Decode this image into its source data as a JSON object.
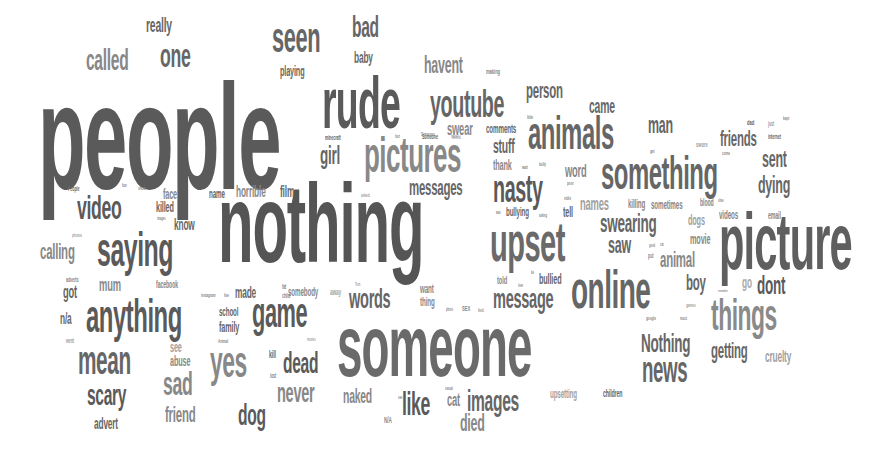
{
  "colors": {
    "dark": "#555555",
    "mid": "#6e6e6e",
    "light": "#8c8c8c",
    "faint": "#a8a8a8"
  },
  "words": [
    {
      "text": "people",
      "x": 38,
      "y": 62,
      "size": 150,
      "sx": 0.52,
      "c": "#5a5a5a"
    },
    {
      "text": "nothing",
      "x": 218,
      "y": 168,
      "size": 112,
      "sx": 0.52,
      "c": "#555555"
    },
    {
      "text": "someone",
      "x": 337,
      "y": 302,
      "size": 88,
      "sx": 0.52,
      "c": "#6a6a6a"
    },
    {
      "text": "picture",
      "x": 719,
      "y": 202,
      "size": 80,
      "sx": 0.52,
      "c": "#5f5f5f"
    },
    {
      "text": "rude",
      "x": 322,
      "y": 67,
      "size": 72,
      "sx": 0.52,
      "c": "#5a5a5a"
    },
    {
      "text": "upset",
      "x": 490,
      "y": 214,
      "size": 56,
      "sx": 0.52,
      "c": "#6a6a6a"
    },
    {
      "text": "online",
      "x": 571,
      "y": 262,
      "size": 54,
      "sx": 0.52,
      "c": "#666666"
    },
    {
      "text": "pictures",
      "x": 364,
      "y": 130,
      "size": 50,
      "sx": 0.52,
      "c": "#888888"
    },
    {
      "text": "something",
      "x": 601,
      "y": 150,
      "size": 46,
      "sx": 0.52,
      "c": "#666666"
    },
    {
      "text": "animals",
      "x": 528,
      "y": 110,
      "size": 46,
      "sx": 0.52,
      "c": "#666666"
    },
    {
      "text": "saying",
      "x": 97,
      "y": 226,
      "size": 48,
      "sx": 0.52,
      "c": "#5a5a5a"
    },
    {
      "text": "anything",
      "x": 86,
      "y": 293,
      "size": 46,
      "sx": 0.52,
      "c": "#5a5a5a"
    },
    {
      "text": "seen",
      "x": 272,
      "y": 17,
      "size": 42,
      "sx": 0.52,
      "c": "#666666"
    },
    {
      "text": "youtube",
      "x": 430,
      "y": 85,
      "size": 38,
      "sx": 0.52,
      "c": "#666666"
    },
    {
      "text": "mean",
      "x": 78,
      "y": 340,
      "size": 40,
      "sx": 0.52,
      "c": "#666666"
    },
    {
      "text": "game",
      "x": 252,
      "y": 292,
      "size": 42,
      "sx": 0.52,
      "c": "#5a5a5a"
    },
    {
      "text": "yes",
      "x": 210,
      "y": 340,
      "size": 44,
      "sx": 0.52,
      "c": "#888888"
    },
    {
      "text": "things",
      "x": 711,
      "y": 293,
      "size": 44,
      "sx": 0.52,
      "c": "#8a8a8a"
    },
    {
      "text": "nasty",
      "x": 493,
      "y": 170,
      "size": 38,
      "sx": 0.52,
      "c": "#5a5a5a"
    },
    {
      "text": "video",
      "x": 77,
      "y": 190,
      "size": 34,
      "sx": 0.52,
      "c": "#5a5a5a"
    },
    {
      "text": "one",
      "x": 160,
      "y": 38,
      "size": 34,
      "sx": 0.52,
      "c": "#666666"
    },
    {
      "text": "called",
      "x": 86,
      "y": 45,
      "size": 30,
      "sx": 0.52,
      "c": "#888888"
    },
    {
      "text": "bad",
      "x": 352,
      "y": 12,
      "size": 30,
      "sx": 0.52,
      "c": "#666666"
    },
    {
      "text": "sad",
      "x": 163,
      "y": 366,
      "size": 34,
      "sx": 0.52,
      "c": "#888888"
    },
    {
      "text": "scary",
      "x": 87,
      "y": 380,
      "size": 30,
      "sx": 0.52,
      "c": "#5a5a5a"
    },
    {
      "text": "news",
      "x": 642,
      "y": 352,
      "size": 36,
      "sx": 0.52,
      "c": "#666666"
    },
    {
      "text": "Nothing",
      "x": 641,
      "y": 330,
      "size": 26,
      "sx": 0.52,
      "c": "#666666"
    },
    {
      "text": "dead",
      "x": 283,
      "y": 348,
      "size": 30,
      "sx": 0.52,
      "c": "#5a5a5a"
    },
    {
      "text": "never",
      "x": 277,
      "y": 379,
      "size": 28,
      "sx": 0.52,
      "c": "#888888"
    },
    {
      "text": "like",
      "x": 402,
      "y": 386,
      "size": 34,
      "sx": 0.52,
      "c": "#5a5a5a"
    },
    {
      "text": "images",
      "x": 467,
      "y": 386,
      "size": 30,
      "sx": 0.52,
      "c": "#666666"
    },
    {
      "text": "words",
      "x": 349,
      "y": 285,
      "size": 28,
      "sx": 0.52,
      "c": "#666666"
    },
    {
      "text": "message",
      "x": 493,
      "y": 285,
      "size": 28,
      "sx": 0.52,
      "c": "#666666"
    },
    {
      "text": "dog",
      "x": 238,
      "y": 400,
      "size": 30,
      "sx": 0.52,
      "c": "#5a5a5a"
    },
    {
      "text": "died",
      "x": 460,
      "y": 411,
      "size": 24,
      "sx": 0.52,
      "c": "#888888"
    },
    {
      "text": "naked",
      "x": 343,
      "y": 386,
      "size": 20,
      "sx": 0.52,
      "c": "#888888"
    },
    {
      "text": "cat",
      "x": 447,
      "y": 391,
      "size": 18,
      "sx": 0.52,
      "c": "#888888"
    },
    {
      "text": "girl",
      "x": 320,
      "y": 142,
      "size": 26,
      "sx": 0.52,
      "c": "#666666"
    },
    {
      "text": "messages",
      "x": 409,
      "y": 177,
      "size": 22,
      "sx": 0.52,
      "c": "#666666"
    },
    {
      "text": "havent",
      "x": 424,
      "y": 53,
      "size": 24,
      "sx": 0.52,
      "c": "#888888"
    },
    {
      "text": "person",
      "x": 526,
      "y": 80,
      "size": 22,
      "sx": 0.52,
      "c": "#666666"
    },
    {
      "text": "came",
      "x": 589,
      "y": 96,
      "size": 20,
      "sx": 0.52,
      "c": "#666666"
    },
    {
      "text": "man",
      "x": 648,
      "y": 113,
      "size": 24,
      "sx": 0.52,
      "c": "#666666"
    },
    {
      "text": "friends",
      "x": 720,
      "y": 128,
      "size": 22,
      "sx": 0.52,
      "c": "#666666"
    },
    {
      "text": "sent",
      "x": 762,
      "y": 147,
      "size": 24,
      "sx": 0.52,
      "c": "#666666"
    },
    {
      "text": "dying",
      "x": 758,
      "y": 173,
      "size": 24,
      "sx": 0.52,
      "c": "#666666"
    },
    {
      "text": "swearing",
      "x": 600,
      "y": 210,
      "size": 26,
      "sx": 0.52,
      "c": "#666666"
    },
    {
      "text": "saw",
      "x": 608,
      "y": 233,
      "size": 24,
      "sx": 0.52,
      "c": "#666666"
    },
    {
      "text": "animal",
      "x": 660,
      "y": 249,
      "size": 22,
      "sx": 0.52,
      "c": "#888888"
    },
    {
      "text": "boy",
      "x": 686,
      "y": 272,
      "size": 22,
      "sx": 0.52,
      "c": "#666666"
    },
    {
      "text": "dont",
      "x": 757,
      "y": 272,
      "size": 26,
      "sx": 0.52,
      "c": "#5a5a5a"
    },
    {
      "text": "go",
      "x": 742,
      "y": 275,
      "size": 16,
      "sx": 0.52,
      "c": "#a8a8a8"
    },
    {
      "text": "getting",
      "x": 711,
      "y": 340,
      "size": 22,
      "sx": 0.52,
      "c": "#666666"
    },
    {
      "text": "cruelty",
      "x": 765,
      "y": 349,
      "size": 16,
      "sx": 0.52,
      "c": "#a0a0a0"
    },
    {
      "text": "stuff",
      "x": 493,
      "y": 136,
      "size": 20,
      "sx": 0.52,
      "c": "#666666"
    },
    {
      "text": "thank",
      "x": 493,
      "y": 158,
      "size": 14,
      "sx": 0.52,
      "c": "#888888"
    },
    {
      "text": "word",
      "x": 565,
      "y": 162,
      "size": 18,
      "sx": 0.52,
      "c": "#888888"
    },
    {
      "text": "names",
      "x": 580,
      "y": 195,
      "size": 18,
      "sx": 0.52,
      "c": "#a0a0a0"
    },
    {
      "text": "swear",
      "x": 447,
      "y": 120,
      "size": 18,
      "sx": 0.52,
      "c": "#888888"
    },
    {
      "text": "comments",
      "x": 486,
      "y": 123,
      "size": 12,
      "sx": 0.52,
      "c": "#666666"
    },
    {
      "text": "really",
      "x": 146,
      "y": 15,
      "size": 20,
      "sx": 0.52,
      "c": "#666666"
    },
    {
      "text": "baby",
      "x": 354,
      "y": 50,
      "size": 16,
      "sx": 0.52,
      "c": "#666666"
    },
    {
      "text": "playing",
      "x": 280,
      "y": 64,
      "size": 14,
      "sx": 0.52,
      "c": "#666666"
    },
    {
      "text": "calling",
      "x": 40,
      "y": 241,
      "size": 22,
      "sx": 0.52,
      "c": "#888888"
    },
    {
      "text": "got",
      "x": 63,
      "y": 283,
      "size": 18,
      "sx": 0.52,
      "c": "#666666"
    },
    {
      "text": "mum",
      "x": 99,
      "y": 276,
      "size": 18,
      "sx": 0.52,
      "c": "#888888"
    },
    {
      "text": "n/a",
      "x": 60,
      "y": 311,
      "size": 16,
      "sx": 0.52,
      "c": "#666666"
    },
    {
      "text": "friend",
      "x": 165,
      "y": 404,
      "size": 22,
      "sx": 0.52,
      "c": "#888888"
    },
    {
      "text": "advert",
      "x": 94,
      "y": 416,
      "size": 16,
      "sx": 0.52,
      "c": "#666666"
    },
    {
      "text": "abuse",
      "x": 170,
      "y": 354,
      "size": 14,
      "sx": 0.52,
      "c": "#888888"
    },
    {
      "text": "see",
      "x": 170,
      "y": 340,
      "size": 14,
      "sx": 0.52,
      "c": "#a0a0a0"
    },
    {
      "text": "school",
      "x": 219,
      "y": 306,
      "size": 12,
      "sx": 0.52,
      "c": "#666666"
    },
    {
      "text": "family",
      "x": 219,
      "y": 320,
      "size": 14,
      "sx": 0.52,
      "c": "#666666"
    },
    {
      "text": "made",
      "x": 235,
      "y": 285,
      "size": 16,
      "sx": 0.52,
      "c": "#666666"
    },
    {
      "text": "face",
      "x": 163,
      "y": 187,
      "size": 14,
      "sx": 0.52,
      "c": "#888888"
    },
    {
      "text": "killed",
      "x": 156,
      "y": 200,
      "size": 14,
      "sx": 0.52,
      "c": "#666666"
    },
    {
      "text": "know",
      "x": 174,
      "y": 217,
      "size": 16,
      "sx": 0.52,
      "c": "#666666"
    },
    {
      "text": "name",
      "x": 209,
      "y": 188,
      "size": 12,
      "sx": 0.52,
      "c": "#666666"
    },
    {
      "text": "horrible",
      "x": 236,
      "y": 184,
      "size": 16,
      "sx": 0.52,
      "c": "#888888"
    },
    {
      "text": "film",
      "x": 280,
      "y": 184,
      "size": 16,
      "sx": 0.52,
      "c": "#666666"
    },
    {
      "text": "facebook",
      "x": 156,
      "y": 280,
      "size": 10,
      "sx": 0.52,
      "c": "#888888"
    },
    {
      "text": "somebody",
      "x": 288,
      "y": 286,
      "size": 12,
      "sx": 0.52,
      "c": "#888888"
    },
    {
      "text": "away",
      "x": 330,
      "y": 288,
      "size": 9,
      "sx": 0.52,
      "c": "#a0a0a0"
    },
    {
      "text": "want",
      "x": 420,
      "y": 283,
      "size": 12,
      "sx": 0.52,
      "c": "#888888"
    },
    {
      "text": "thing",
      "x": 420,
      "y": 296,
      "size": 12,
      "sx": 0.52,
      "c": "#888888"
    },
    {
      "text": "told",
      "x": 497,
      "y": 275,
      "size": 11,
      "sx": 0.52,
      "c": "#888888"
    },
    {
      "text": "bullied",
      "x": 539,
      "y": 272,
      "size": 14,
      "sx": 0.52,
      "c": "#666666"
    },
    {
      "text": "bullying",
      "x": 506,
      "y": 206,
      "size": 12,
      "sx": 0.52,
      "c": "#666666"
    },
    {
      "text": "tell",
      "x": 563,
      "y": 205,
      "size": 14,
      "sx": 0.52,
      "c": "#666666"
    },
    {
      "text": "killing",
      "x": 628,
      "y": 198,
      "size": 12,
      "sx": 0.52,
      "c": "#888888"
    },
    {
      "text": "sometimes",
      "x": 651,
      "y": 199,
      "size": 12,
      "sx": 0.52,
      "c": "#888888"
    },
    {
      "text": "dogs",
      "x": 688,
      "y": 213,
      "size": 14,
      "sx": 0.52,
      "c": "#a0a0a0"
    },
    {
      "text": "movie",
      "x": 690,
      "y": 232,
      "size": 14,
      "sx": 0.52,
      "c": "#888888"
    },
    {
      "text": "blood",
      "x": 700,
      "y": 198,
      "size": 10,
      "sx": 0.52,
      "c": "#888888"
    },
    {
      "text": "videos",
      "x": 719,
      "y": 209,
      "size": 12,
      "sx": 0.52,
      "c": "#888888"
    },
    {
      "text": "email",
      "x": 768,
      "y": 211,
      "size": 10,
      "sx": 0.52,
      "c": "#888888"
    },
    {
      "text": "upsetting",
      "x": 550,
      "y": 388,
      "size": 12,
      "sx": 0.52,
      "c": "#a0a0a0"
    },
    {
      "text": "children",
      "x": 603,
      "y": 389,
      "size": 10,
      "sx": 0.52,
      "c": "#666666"
    },
    {
      "text": "N/A",
      "x": 384,
      "y": 416,
      "size": 9,
      "sx": 0.52,
      "c": "#888888"
    },
    {
      "text": "kill",
      "x": 269,
      "y": 350,
      "size": 10,
      "sx": 0.52,
      "c": "#666666"
    },
    {
      "text": "lost",
      "x": 270,
      "y": 372,
      "size": 7,
      "sx": 0.52,
      "c": "#888888"
    },
    {
      "text": "adverts",
      "x": 66,
      "y": 276,
      "size": 7,
      "sx": 0.52,
      "c": "#888888"
    },
    {
      "text": "photos",
      "x": 72,
      "y": 232,
      "size": 6,
      "sx": 0.52,
      "c": "#a0a0a0"
    },
    {
      "text": "went",
      "x": 66,
      "y": 337,
      "size": 7,
      "sx": 0.52,
      "c": "#a0a0a0"
    },
    {
      "text": "People",
      "x": 68,
      "y": 185,
      "size": 7,
      "sx": 0.52,
      "c": "#666666"
    },
    {
      "text": "fun",
      "x": 122,
      "y": 182,
      "size": 6,
      "sx": 0.52,
      "c": "#888888"
    },
    {
      "text": "show",
      "x": 138,
      "y": 185,
      "size": 6,
      "sx": 0.52,
      "c": "#888888"
    },
    {
      "text": "images",
      "x": 157,
      "y": 216,
      "size": 5,
      "sx": 0.52,
      "c": "#888888"
    },
    {
      "text": "instagram",
      "x": 201,
      "y": 292,
      "size": 6,
      "sx": 0.52,
      "c": "#888888"
    },
    {
      "text": "live",
      "x": 224,
      "y": 292,
      "size": 6,
      "sx": 0.52,
      "c": "#888888"
    },
    {
      "text": "Animal",
      "x": 218,
      "y": 338,
      "size": 6,
      "sx": 0.52,
      "c": "#888888"
    },
    {
      "text": "fat",
      "x": 282,
      "y": 283,
      "size": 7,
      "sx": 0.52,
      "c": "#888888"
    },
    {
      "text": "child",
      "x": 282,
      "y": 292,
      "size": 7,
      "sx": 0.52,
      "c": "#888888"
    },
    {
      "text": "movies",
      "x": 307,
      "y": 337,
      "size": 5,
      "sx": 0.52,
      "c": "#a0a0a0"
    },
    {
      "text": "Tom",
      "x": 355,
      "y": 282,
      "size": 5,
      "sx": 0.52,
      "c": "#a0a0a0"
    },
    {
      "text": "photo",
      "x": 446,
      "y": 307,
      "size": 5,
      "sx": 0.52,
      "c": "#888888"
    },
    {
      "text": "SEX",
      "x": 462,
      "y": 305,
      "size": 8,
      "sx": 0.52,
      "c": "#888888"
    },
    {
      "text": "food",
      "x": 478,
      "y": 308,
      "size": 5,
      "sx": 0.52,
      "c": "#888888"
    },
    {
      "text": "love",
      "x": 518,
      "y": 283,
      "size": 5,
      "sx": 0.52,
      "c": "#888888"
    },
    {
      "text": "be",
      "x": 531,
      "y": 270,
      "size": 5,
      "sx": 0.52,
      "c": "#888888"
    },
    {
      "text": "sexual",
      "x": 445,
      "y": 386,
      "size": 5,
      "sx": 0.52,
      "c": "#888888"
    },
    {
      "text": "see",
      "x": 398,
      "y": 395,
      "size": 5,
      "sx": 0.52,
      "c": "#888888"
    },
    {
      "text": "minecraft",
      "x": 325,
      "y": 134,
      "size": 7,
      "sx": 0.52,
      "c": "#666666"
    },
    {
      "text": "hurt",
      "x": 395,
      "y": 134,
      "size": 5,
      "sx": 0.52,
      "c": "#888888"
    },
    {
      "text": "Someone",
      "x": 422,
      "y": 133,
      "size": 7,
      "sx": 0.52,
      "c": "#666666"
    },
    {
      "text": "horror",
      "x": 451,
      "y": 134,
      "size": 5,
      "sx": 0.52,
      "c": "#a0a0a0"
    },
    {
      "text": "asked",
      "x": 361,
      "y": 192,
      "size": 6,
      "sx": 0.52,
      "c": "#a0a0a0"
    },
    {
      "text": "making",
      "x": 486,
      "y": 68,
      "size": 8,
      "sx": 0.52,
      "c": "#888888"
    },
    {
      "text": "little",
      "x": 527,
      "y": 114,
      "size": 6,
      "sx": 0.52,
      "c": "#888888"
    },
    {
      "text": "Someone",
      "x": 421,
      "y": 131,
      "size": 6,
      "sx": 0.52,
      "c": "#888888"
    },
    {
      "text": "horrid",
      "x": 452,
      "y": 134,
      "size": 6,
      "sx": 0.52,
      "c": "#a0a0a0"
    },
    {
      "text": "wait",
      "x": 522,
      "y": 164,
      "size": 6,
      "sx": 0.52,
      "c": "#888888"
    },
    {
      "text": "bully",
      "x": 539,
      "y": 161,
      "size": 6,
      "sx": 0.52,
      "c": "#888888"
    },
    {
      "text": "poor",
      "x": 567,
      "y": 180,
      "size": 6,
      "sx": 0.52,
      "c": "#888888"
    },
    {
      "text": "vidio",
      "x": 564,
      "y": 195,
      "size": 6,
      "sx": 0.52,
      "c": "#888888"
    },
    {
      "text": "was",
      "x": 496,
      "y": 210,
      "size": 5,
      "sx": 0.52,
      "c": "#888888"
    },
    {
      "text": "asking",
      "x": 539,
      "y": 213,
      "size": 5,
      "sx": 0.52,
      "c": "#888888"
    },
    {
      "text": "get",
      "x": 650,
      "y": 148,
      "size": 6,
      "sx": 0.52,
      "c": "#888888"
    },
    {
      "text": "swore",
      "x": 696,
      "y": 141,
      "size": 8,
      "sx": 0.52,
      "c": "#a0a0a0"
    },
    {
      "text": "come",
      "x": 722,
      "y": 150,
      "size": 6,
      "sx": 0.52,
      "c": "#888888"
    },
    {
      "text": "dad",
      "x": 747,
      "y": 119,
      "size": 8,
      "sx": 0.52,
      "c": "#666666"
    },
    {
      "text": "just",
      "x": 768,
      "y": 120,
      "size": 7,
      "sx": 0.52,
      "c": "#a0a0a0"
    },
    {
      "text": "kept",
      "x": 783,
      "y": 115,
      "size": 6,
      "sx": 0.52,
      "c": "#888888"
    },
    {
      "text": "internet",
      "x": 768,
      "y": 133,
      "size": 7,
      "sx": 0.52,
      "c": "#666666"
    },
    {
      "text": "shes",
      "x": 718,
      "y": 198,
      "size": 5,
      "sx": 0.52,
      "c": "#888888"
    },
    {
      "text": "good",
      "x": 649,
      "y": 243,
      "size": 5,
      "sx": 0.52,
      "c": "#888888"
    },
    {
      "text": "car",
      "x": 660,
      "y": 242,
      "size": 5,
      "sx": 0.52,
      "c": "#888888"
    },
    {
      "text": "put",
      "x": 648,
      "y": 252,
      "size": 7,
      "sx": 0.52,
      "c": "#888888"
    },
    {
      "text": "remember",
      "x": 718,
      "y": 289,
      "size": 4,
      "sx": 0.52,
      "c": "#888888"
    },
    {
      "text": "games",
      "x": 686,
      "y": 302,
      "size": 6,
      "sx": 0.52,
      "c": "#a0a0a0"
    },
    {
      "text": "google",
      "x": 646,
      "y": 315,
      "size": 6,
      "sx": 0.52,
      "c": "#888888"
    },
    {
      "text": "music",
      "x": 680,
      "y": 316,
      "size": 5,
      "sx": 0.52,
      "c": "#888888"
    }
  ]
}
